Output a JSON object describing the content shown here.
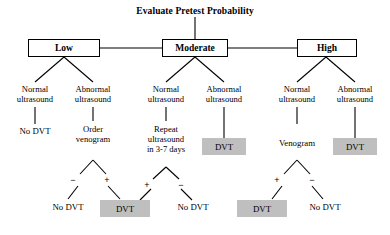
{
  "diagram": {
    "title": "Evaluate Pretest Probability",
    "type": "clinical-decision-tree",
    "colors": {
      "positive_outcome_fill": "#bfbfbf",
      "box_stroke": "#000000",
      "background": "#ffffff"
    },
    "tiers": [
      {
        "id": "low",
        "label": "Low"
      },
      {
        "id": "moderate",
        "label": "Moderate"
      },
      {
        "id": "high",
        "label": "High"
      }
    ],
    "ultrasound_results": [
      {
        "id": "low-normal",
        "line1": "Normal",
        "line2": "ultrasound"
      },
      {
        "id": "low-abnormal",
        "line1": "Abnormal",
        "line2": "ultrasound"
      },
      {
        "id": "mod-normal",
        "line1": "Normal",
        "line2": "ultrasound"
      },
      {
        "id": "mod-abnormal",
        "line1": "Abnormal",
        "line2": "ultrasound"
      },
      {
        "id": "high-normal",
        "line1": "Normal",
        "line2": "ultrasound"
      },
      {
        "id": "high-abnormal",
        "line1": "Abnormal",
        "line2": "ultrasound"
      }
    ],
    "actions": [
      {
        "id": "low-normal-result",
        "line1": "No DVT",
        "line2": "",
        "line3": ""
      },
      {
        "id": "low-abnormal-action",
        "line1": "Order",
        "line2": "venogram",
        "line3": ""
      },
      {
        "id": "mod-normal-action",
        "line1": "Repeat",
        "line2": "ultrasound",
        "line3": "in 3-7 days"
      },
      {
        "id": "mod-abnormal-result",
        "line1": "DVT",
        "line2": "",
        "line3": ""
      },
      {
        "id": "high-normal-action",
        "line1": "Venogram",
        "line2": "",
        "line3": ""
      },
      {
        "id": "high-abnormal-result",
        "line1": "DVT",
        "line2": "",
        "line3": ""
      }
    ],
    "signs": [
      {
        "id": "venogram-low-neg",
        "label": "−"
      },
      {
        "id": "venogram-low-pos",
        "label": "+"
      },
      {
        "id": "repeat-us-pos",
        "label": "+"
      },
      {
        "id": "repeat-us-neg",
        "label": "−"
      },
      {
        "id": "venogram-high-pos",
        "label": "+"
      },
      {
        "id": "venogram-high-neg",
        "label": "−"
      }
    ],
    "outcomes": [
      {
        "id": "outcome-1",
        "label": "No DVT",
        "positive": false
      },
      {
        "id": "outcome-2",
        "label": "DVT",
        "positive": true
      },
      {
        "id": "outcome-3",
        "label": "No DVT",
        "positive": false
      },
      {
        "id": "outcome-4",
        "label": "DVT",
        "positive": true
      },
      {
        "id": "outcome-5",
        "label": "No DVT",
        "positive": false
      }
    ]
  }
}
